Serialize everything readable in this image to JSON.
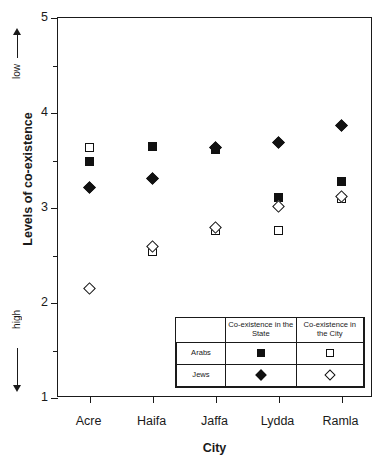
{
  "chart_data": {
    "type": "scatter",
    "title": "",
    "xlabel": "City",
    "ylabel": "Levels of co-existence",
    "categories": [
      "Acre",
      "Haifa",
      "Jaffa",
      "Lydda",
      "Ramla"
    ],
    "ylim": [
      1,
      5
    ],
    "yticks": [
      1,
      2,
      3,
      4,
      5
    ],
    "ytick_labels": [
      "1",
      "2",
      "3",
      "4",
      "5"
    ],
    "yminor_ticks": [
      1.5,
      2.5,
      3.5,
      4.5
    ],
    "grid": false,
    "y_direction_top_label": "low",
    "y_direction_bottom_label": "high",
    "legend_position": "inside-lower-right",
    "series": [
      {
        "name": "Arabs — Co-existence in the State",
        "group": "Arabs",
        "measure": "Co-existence in the State",
        "marker": "filled-square",
        "values": [
          3.49,
          3.65,
          3.62,
          3.11,
          3.28
        ]
      },
      {
        "name": "Jews — Co-existence in the State",
        "group": "Jews",
        "measure": "Co-existence in the State",
        "marker": "filled-diamond",
        "values": [
          3.22,
          3.31,
          3.64,
          3.69,
          3.87
        ]
      },
      {
        "name": "Arabs — Co-existence in the City",
        "group": "Arabs",
        "measure": "Co-existence in the City",
        "marker": "open-square",
        "values": [
          3.64,
          2.54,
          2.76,
          2.76,
          3.1
        ]
      },
      {
        "name": "Jews — Co-existence in the City",
        "group": "Jews",
        "measure": "Co-existence in the City",
        "marker": "open-diamond",
        "values": [
          2.15,
          2.6,
          2.79,
          3.02,
          3.12
        ]
      }
    ]
  },
  "legend": {
    "corner_label": "",
    "columns": [
      "Co-existence in the State",
      "Co-existence in the City"
    ],
    "rows": [
      {
        "label": "Arabs",
        "state_marker": "filled-square",
        "city_marker": "open-square"
      },
      {
        "label": "Jews",
        "state_marker": "filled-diamond",
        "city_marker": "open-diamond"
      }
    ]
  },
  "colors": {
    "marker": "#111111",
    "axis": "#1a1a1a",
    "background": "#ffffff"
  }
}
